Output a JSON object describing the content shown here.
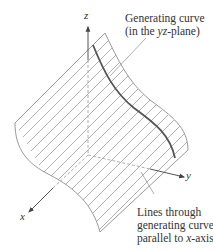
{
  "figure": {
    "type": "3d-surface-diagram",
    "colors": {
      "surface_edge": "#9a9a9a",
      "ruling_lines": "#a8a8a8",
      "generating_curve": "#555555",
      "axes": "#555555",
      "text": "#333333"
    }
  },
  "axes": {
    "x": {
      "label": "x"
    },
    "y": {
      "label": "y"
    },
    "z": {
      "label": "z"
    }
  },
  "annotations": {
    "generating_curve": {
      "line1": "Generating curve",
      "line2_prefix": "(in the ",
      "line2_var": "yz",
      "line2_suffix": "-plane)"
    },
    "rulings": {
      "line1": "Lines through",
      "line2": "generating curve",
      "line3_prefix": "parallel to ",
      "line3_var": "x",
      "line3_suffix": "-axis"
    }
  }
}
